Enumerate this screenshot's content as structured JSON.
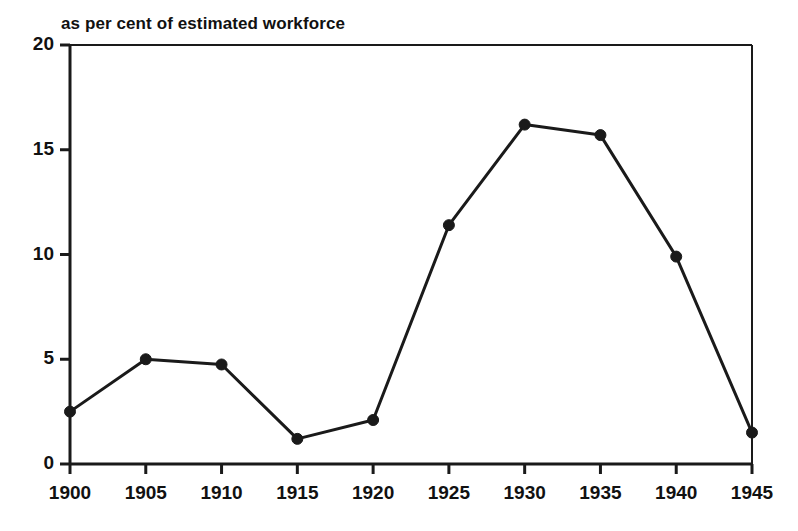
{
  "chart_data": {
    "type": "line",
    "title": "as per cent of estimated workforce",
    "subtitle": "",
    "xlabel": "",
    "ylabel": "",
    "x": [
      1900,
      1905,
      1910,
      1915,
      1920,
      1925,
      1930,
      1935,
      1940,
      1945
    ],
    "values": [
      2.5,
      5.0,
      4.75,
      1.2,
      2.1,
      11.4,
      16.2,
      15.7,
      9.9,
      1.5
    ],
    "series": [
      {
        "name": "as per cent of estimated workforce",
        "values": [
          2.5,
          5.0,
          4.75,
          1.2,
          2.1,
          11.4,
          16.2,
          15.7,
          9.9,
          1.5
        ]
      }
    ],
    "xlim": [
      1900,
      1945
    ],
    "ylim": [
      0,
      20
    ],
    "xticks": [
      1900,
      1905,
      1910,
      1915,
      1920,
      1925,
      1930,
      1935,
      1940,
      1945
    ],
    "yticks": [
      0,
      5,
      10,
      15,
      20
    ],
    "xtick_labels": [
      "1900",
      "1905",
      "1910",
      "1915",
      "1920",
      "1925",
      "1930",
      "1935",
      "1940",
      "1945"
    ],
    "ytick_labels": [
      "0",
      "5",
      "10",
      "15",
      "20"
    ],
    "grid": false,
    "legend": false,
    "legend_position": "none",
    "marker": "filled-circle",
    "line_color": "#1a1a1a",
    "marker_color": "#1a1a1a",
    "axis_color": "#1a1a1a",
    "background_color": "#ffffff"
  },
  "figure": {
    "title": "as per cent of estimated workforce"
  }
}
